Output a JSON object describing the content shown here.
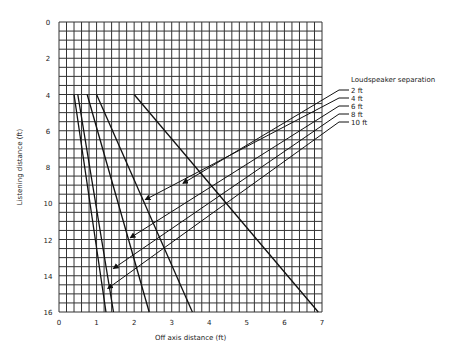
{
  "chart_data": {
    "type": "line",
    "title": "",
    "xlabel": "Off axis distance (ft)",
    "ylabel": "Listening distance (ft)",
    "xlim": [
      0,
      7
    ],
    "ylim": [
      16,
      0
    ],
    "x_ticks": [
      "0",
      "1",
      "2",
      "3",
      "4",
      "5",
      "6",
      "7"
    ],
    "y_ticks": [
      "0",
      "2",
      "4",
      "6",
      "8",
      "10",
      "12",
      "14",
      "16"
    ],
    "grid": {
      "x_step": 0.2,
      "y_step": 0.5
    },
    "legend": {
      "title": "Loudspeaker separation",
      "position": "right",
      "entries": [
        "2 ft",
        "4 ft",
        "6 ft",
        "8 ft",
        "10 ft"
      ]
    },
    "series": [
      {
        "name": "10 ft",
        "points": [
          [
            0.4,
            4
          ],
          [
            1.25,
            16
          ]
        ]
      },
      {
        "name": "8 ft",
        "points": [
          [
            0.5,
            4
          ],
          [
            1.45,
            16
          ]
        ]
      },
      {
        "name": "6 ft",
        "points": [
          [
            0.75,
            4
          ],
          [
            2.4,
            16
          ]
        ]
      },
      {
        "name": "4 ft",
        "points": [
          [
            1.0,
            4
          ],
          [
            3.55,
            16
          ]
        ]
      },
      {
        "name": "2 ft",
        "points": [
          [
            2.0,
            4
          ],
          [
            6.9,
            16
          ]
        ]
      }
    ],
    "arrows": [
      {
        "label": "2 ft",
        "tip": [
          3.3,
          8.9
        ]
      },
      {
        "label": "4 ft",
        "tip": [
          2.3,
          9.8
        ]
      },
      {
        "label": "6 ft",
        "tip": [
          1.9,
          11.9
        ]
      },
      {
        "label": "8 ft",
        "tip": [
          1.45,
          13.6
        ]
      },
      {
        "label": "10 ft",
        "tip": [
          1.3,
          14.7
        ]
      }
    ]
  }
}
